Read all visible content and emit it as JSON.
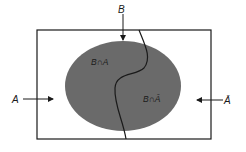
{
  "diagram": {
    "type": "venn",
    "labels": {
      "B": "B",
      "A": "A",
      "A_bar": "Ā",
      "region_left": "B∩A",
      "region_right": "B∩Ā"
    },
    "colors": {
      "ellipse_fill": "#6a6a6a",
      "stroke": "#1a1a1a",
      "background": "#ffffff"
    }
  }
}
